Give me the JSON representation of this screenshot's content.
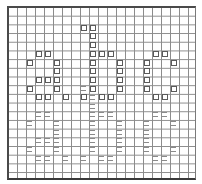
{
  "board": {
    "columns": 21,
    "rows": 20,
    "grid_color": "#8c8c8c",
    "border_color": "#4a4a4a",
    "symbols": {
      "square": "□",
      "equals": "="
    },
    "cells": [
      {
        "c": 8,
        "r": 2,
        "t": "square"
      },
      {
        "c": 9,
        "r": 2,
        "t": "square"
      },
      {
        "c": 9,
        "r": 3,
        "t": "square"
      },
      {
        "c": 9,
        "r": 4,
        "t": "square"
      },
      {
        "c": 3,
        "r": 5,
        "t": "square"
      },
      {
        "c": 4,
        "r": 5,
        "t": "square"
      },
      {
        "c": 9,
        "r": 5,
        "t": "square"
      },
      {
        "c": 10,
        "r": 5,
        "t": "square"
      },
      {
        "c": 11,
        "r": 5,
        "t": "square"
      },
      {
        "c": 16,
        "r": 5,
        "t": "square"
      },
      {
        "c": 17,
        "r": 5,
        "t": "square"
      },
      {
        "c": 2,
        "r": 6,
        "t": "square"
      },
      {
        "c": 5,
        "r": 6,
        "t": "square"
      },
      {
        "c": 9,
        "r": 6,
        "t": "square"
      },
      {
        "c": 12,
        "r": 6,
        "t": "square"
      },
      {
        "c": 15,
        "r": 6,
        "t": "square"
      },
      {
        "c": 18,
        "r": 6,
        "t": "square"
      },
      {
        "c": 5,
        "r": 7,
        "t": "square"
      },
      {
        "c": 9,
        "r": 7,
        "t": "square"
      },
      {
        "c": 12,
        "r": 7,
        "t": "square"
      },
      {
        "c": 15,
        "r": 7,
        "t": "square"
      },
      {
        "c": 3,
        "r": 8,
        "t": "square"
      },
      {
        "c": 4,
        "r": 8,
        "t": "square"
      },
      {
        "c": 5,
        "r": 8,
        "t": "square"
      },
      {
        "c": 9,
        "r": 8,
        "t": "square"
      },
      {
        "c": 12,
        "r": 8,
        "t": "square"
      },
      {
        "c": 15,
        "r": 8,
        "t": "square"
      },
      {
        "c": 2,
        "r": 9,
        "t": "square"
      },
      {
        "c": 5,
        "r": 9,
        "t": "square"
      },
      {
        "c": 8,
        "r": 9,
        "t": "equals"
      },
      {
        "c": 9,
        "r": 9,
        "t": "square"
      },
      {
        "c": 12,
        "r": 9,
        "t": "square"
      },
      {
        "c": 15,
        "r": 9,
        "t": "square"
      },
      {
        "c": 18,
        "r": 9,
        "t": "square"
      },
      {
        "c": 3,
        "r": 10,
        "t": "square"
      },
      {
        "c": 4,
        "r": 10,
        "t": "square"
      },
      {
        "c": 6,
        "r": 10,
        "t": "square"
      },
      {
        "c": 8,
        "r": 10,
        "t": "square"
      },
      {
        "c": 9,
        "r": 10,
        "t": "equals"
      },
      {
        "c": 10,
        "r": 10,
        "t": "square"
      },
      {
        "c": 11,
        "r": 10,
        "t": "square"
      },
      {
        "c": 16,
        "r": 10,
        "t": "square"
      },
      {
        "c": 17,
        "r": 10,
        "t": "square"
      },
      {
        "c": 9,
        "r": 11,
        "t": "equals"
      },
      {
        "c": 3,
        "r": 12,
        "t": "equals"
      },
      {
        "c": 4,
        "r": 12,
        "t": "equals"
      },
      {
        "c": 9,
        "r": 12,
        "t": "equals"
      },
      {
        "c": 10,
        "r": 12,
        "t": "equals"
      },
      {
        "c": 11,
        "r": 12,
        "t": "equals"
      },
      {
        "c": 16,
        "r": 12,
        "t": "equals"
      },
      {
        "c": 17,
        "r": 12,
        "t": "equals"
      },
      {
        "c": 2,
        "r": 13,
        "t": "equals"
      },
      {
        "c": 5,
        "r": 13,
        "t": "equals"
      },
      {
        "c": 9,
        "r": 13,
        "t": "equals"
      },
      {
        "c": 12,
        "r": 13,
        "t": "equals"
      },
      {
        "c": 15,
        "r": 13,
        "t": "equals"
      },
      {
        "c": 18,
        "r": 13,
        "t": "equals"
      },
      {
        "c": 5,
        "r": 14,
        "t": "equals"
      },
      {
        "c": 9,
        "r": 14,
        "t": "equals"
      },
      {
        "c": 12,
        "r": 14,
        "t": "equals"
      },
      {
        "c": 15,
        "r": 14,
        "t": "equals"
      },
      {
        "c": 3,
        "r": 15,
        "t": "equals"
      },
      {
        "c": 4,
        "r": 15,
        "t": "equals"
      },
      {
        "c": 5,
        "r": 15,
        "t": "equals"
      },
      {
        "c": 9,
        "r": 15,
        "t": "equals"
      },
      {
        "c": 12,
        "r": 15,
        "t": "equals"
      },
      {
        "c": 15,
        "r": 15,
        "t": "equals"
      },
      {
        "c": 2,
        "r": 16,
        "t": "equals"
      },
      {
        "c": 5,
        "r": 16,
        "t": "equals"
      },
      {
        "c": 9,
        "r": 16,
        "t": "equals"
      },
      {
        "c": 12,
        "r": 16,
        "t": "equals"
      },
      {
        "c": 15,
        "r": 16,
        "t": "equals"
      },
      {
        "c": 18,
        "r": 16,
        "t": "equals"
      },
      {
        "c": 3,
        "r": 17,
        "t": "equals"
      },
      {
        "c": 4,
        "r": 17,
        "t": "equals"
      },
      {
        "c": 6,
        "r": 17,
        "t": "equals"
      },
      {
        "c": 8,
        "r": 17,
        "t": "equals"
      },
      {
        "c": 10,
        "r": 17,
        "t": "equals"
      },
      {
        "c": 11,
        "r": 17,
        "t": "equals"
      },
      {
        "c": 16,
        "r": 17,
        "t": "equals"
      },
      {
        "c": 17,
        "r": 17,
        "t": "equals"
      }
    ]
  }
}
